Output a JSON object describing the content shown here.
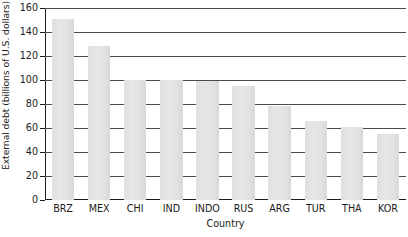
{
  "chart_data": {
    "type": "bar",
    "title": "",
    "xlabel": "Country",
    "ylabel": "External debt (billions of U.S. dollars)",
    "categories": [
      "BRZ",
      "MEX",
      "CHI",
      "IND",
      "INDO",
      "RUS",
      "ARG",
      "TUR",
      "THA",
      "KOR"
    ],
    "values": [
      151,
      128,
      100,
      100,
      99,
      95,
      78,
      66,
      61,
      55
    ],
    "ylim": [
      0,
      160
    ],
    "ytick_labels": [
      "160",
      "140",
      "120",
      "100",
      "80",
      "60",
      "40",
      "20",
      "0"
    ],
    "ytick_values": [
      160,
      140,
      120,
      100,
      80,
      60,
      40,
      20,
      0
    ],
    "grid": true,
    "legend": "none",
    "bar_color": "#e3e3e3",
    "axis_color": "#1c1c1c",
    "grid_color": "#4a4a4a"
  }
}
